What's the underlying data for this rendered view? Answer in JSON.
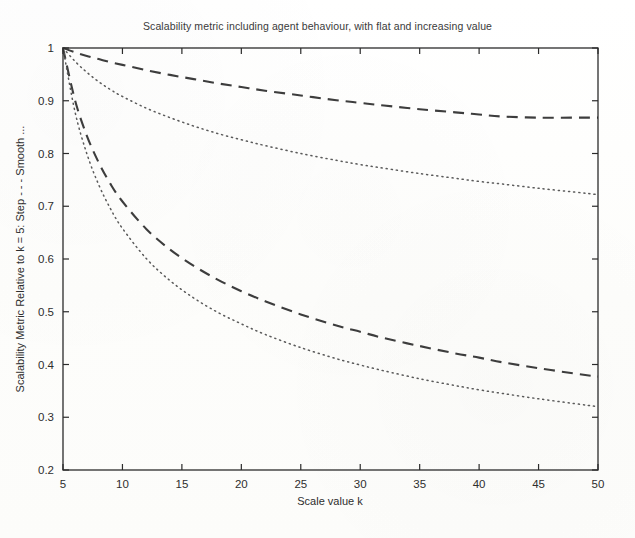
{
  "chart_data": {
    "type": "line",
    "title": "Scalability metric including agent behaviour, with flat and increasing value",
    "xlabel": "Scale value k",
    "ylabel": "Scalability Metric Relative to k = 5: Step - - - Smooth ...",
    "xlim": [
      5,
      50
    ],
    "ylim": [
      0.2,
      1.0
    ],
    "grid": false,
    "legend_position": "none",
    "xticks": [
      5,
      10,
      15,
      20,
      25,
      30,
      35,
      40,
      45,
      50
    ],
    "xtick_labels": [
      "5",
      "10",
      "15",
      "20",
      "25",
      "30",
      "35",
      "40",
      "45",
      "50"
    ],
    "yticks": [
      0.2,
      0.3,
      0.4,
      0.5,
      0.6,
      0.7,
      0.8,
      0.9,
      1.0
    ],
    "ytick_labels": [
      "0.2",
      "0.3",
      "0.4",
      "0.5",
      "0.6",
      "0.7",
      "0.8",
      "0.9",
      "1"
    ],
    "x": [
      5,
      6,
      7,
      8,
      9,
      10,
      12,
      14,
      16,
      18,
      20,
      22,
      25,
      28,
      30,
      32,
      35,
      38,
      40,
      42,
      45,
      48,
      50
    ],
    "series": [
      {
        "name": "Step, increasing value",
        "style": "dashed",
        "color": "#3d3d3d",
        "values": [
          1.0,
          0.992,
          0.985,
          0.979,
          0.973,
          0.968,
          0.958,
          0.949,
          0.941,
          0.933,
          0.926,
          0.919,
          0.91,
          0.901,
          0.896,
          0.891,
          0.884,
          0.878,
          0.874,
          0.87,
          0.868,
          0.868,
          0.868
        ]
      },
      {
        "name": "Smooth, increasing value",
        "style": "dotted",
        "color": "#5a5a5a",
        "values": [
          1.0,
          0.975,
          0.954,
          0.936,
          0.921,
          0.908,
          0.886,
          0.868,
          0.852,
          0.838,
          0.826,
          0.815,
          0.8,
          0.787,
          0.779,
          0.772,
          0.762,
          0.753,
          0.747,
          0.742,
          0.734,
          0.727,
          0.722
        ]
      },
      {
        "name": "Step, flat value",
        "style": "dashed",
        "color": "#3d3d3d",
        "values": [
          1.0,
          0.902,
          0.834,
          0.783,
          0.742,
          0.709,
          0.657,
          0.618,
          0.587,
          0.561,
          0.539,
          0.52,
          0.495,
          0.474,
          0.462,
          0.45,
          0.435,
          0.421,
          0.413,
          0.404,
          0.393,
          0.383,
          0.377
        ]
      },
      {
        "name": "Smooth, flat value",
        "style": "dotted",
        "color": "#5a5a5a",
        "values": [
          1.0,
          0.88,
          0.8,
          0.741,
          0.695,
          0.658,
          0.601,
          0.559,
          0.526,
          0.499,
          0.477,
          0.457,
          0.432,
          0.411,
          0.399,
          0.388,
          0.373,
          0.36,
          0.352,
          0.345,
          0.335,
          0.326,
          0.32
        ]
      }
    ]
  },
  "plot": {
    "axis_color": "#2b2b2b",
    "background": "#fdfdfc"
  }
}
